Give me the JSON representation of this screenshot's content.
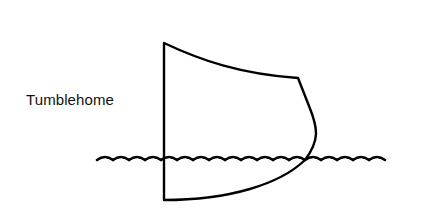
{
  "diagram": {
    "label": "Tumblehome",
    "hull_section": {
      "description": "Cross-section of a ship hull side showing tumblehome (inward slope of hull above waterline)",
      "stroke_color": "#000000"
    },
    "waterline": {
      "description": "Wavy waterline crossing the hull",
      "stroke_color": "#000000"
    }
  }
}
